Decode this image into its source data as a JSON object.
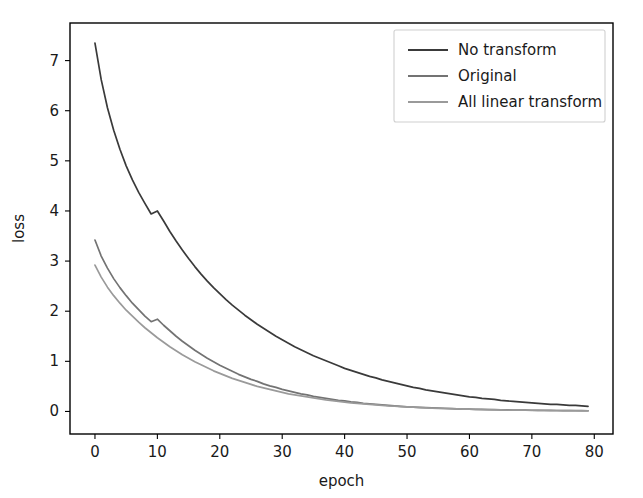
{
  "chart_data": {
    "type": "line",
    "title": "",
    "xlabel": "epoch",
    "ylabel": "loss",
    "xlim": [
      -4,
      83
    ],
    "ylim": [
      -0.45,
      7.75
    ],
    "xticks": [
      0,
      10,
      20,
      30,
      40,
      50,
      60,
      70,
      80
    ],
    "xticklabels": [
      "0",
      "10",
      "20",
      "30",
      "40",
      "50",
      "60",
      "70",
      "80"
    ],
    "yticks": [
      0,
      1,
      2,
      3,
      4,
      5,
      6,
      7
    ],
    "yticklabels": [
      "0",
      "1",
      "2",
      "3",
      "4",
      "5",
      "6",
      "7"
    ],
    "grid": false,
    "legend_position": "upper right",
    "x": [
      0,
      1,
      2,
      3,
      4,
      5,
      6,
      7,
      8,
      9,
      10,
      11,
      12,
      13,
      14,
      15,
      16,
      17,
      18,
      19,
      20,
      21,
      22,
      23,
      24,
      25,
      26,
      27,
      28,
      29,
      30,
      31,
      32,
      33,
      34,
      35,
      36,
      37,
      38,
      39,
      40,
      41,
      42,
      43,
      44,
      45,
      46,
      47,
      48,
      49,
      50,
      51,
      52,
      53,
      54,
      55,
      56,
      57,
      58,
      59,
      60,
      61,
      62,
      63,
      64,
      65,
      66,
      67,
      68,
      69,
      70,
      71,
      72,
      73,
      74,
      75,
      76,
      77,
      78,
      79
    ],
    "series": [
      {
        "name": "No transform",
        "color": "#3a3a3a",
        "values": [
          7.35,
          6.62,
          6.06,
          5.61,
          5.23,
          4.9,
          4.62,
          4.37,
          4.15,
          3.94,
          4.0,
          3.8,
          3.59,
          3.4,
          3.22,
          3.05,
          2.89,
          2.74,
          2.6,
          2.47,
          2.35,
          2.23,
          2.12,
          2.02,
          1.92,
          1.83,
          1.74,
          1.66,
          1.58,
          1.5,
          1.43,
          1.36,
          1.29,
          1.23,
          1.17,
          1.11,
          1.06,
          1.01,
          0.96,
          0.91,
          0.86,
          0.82,
          0.78,
          0.74,
          0.7,
          0.67,
          0.63,
          0.6,
          0.57,
          0.54,
          0.51,
          0.48,
          0.46,
          0.43,
          0.41,
          0.39,
          0.37,
          0.35,
          0.33,
          0.31,
          0.29,
          0.28,
          0.26,
          0.25,
          0.24,
          0.22,
          0.21,
          0.2,
          0.19,
          0.18,
          0.17,
          0.16,
          0.15,
          0.14,
          0.14,
          0.13,
          0.12,
          0.12,
          0.11,
          0.1
        ]
      },
      {
        "name": "Original",
        "color": "#737373",
        "values": [
          3.42,
          3.1,
          2.86,
          2.65,
          2.47,
          2.31,
          2.16,
          2.03,
          1.9,
          1.79,
          1.84,
          1.72,
          1.61,
          1.5,
          1.4,
          1.31,
          1.22,
          1.14,
          1.06,
          0.99,
          0.92,
          0.86,
          0.8,
          0.74,
          0.69,
          0.64,
          0.6,
          0.55,
          0.51,
          0.48,
          0.44,
          0.41,
          0.38,
          0.35,
          0.33,
          0.3,
          0.28,
          0.26,
          0.24,
          0.22,
          0.21,
          0.19,
          0.18,
          0.16,
          0.15,
          0.14,
          0.13,
          0.12,
          0.11,
          0.1,
          0.09,
          0.085,
          0.08,
          0.075,
          0.07,
          0.065,
          0.06,
          0.055,
          0.05,
          0.048,
          0.045,
          0.042,
          0.04,
          0.038,
          0.035,
          0.033,
          0.031,
          0.029,
          0.027,
          0.026,
          0.024,
          0.023,
          0.022,
          0.02,
          0.019,
          0.018,
          0.017,
          0.016,
          0.015,
          0.014
        ]
      },
      {
        "name": "All linear transform",
        "color": "#9a9a9a",
        "values": [
          2.92,
          2.68,
          2.48,
          2.31,
          2.16,
          2.02,
          1.9,
          1.78,
          1.67,
          1.57,
          1.47,
          1.38,
          1.29,
          1.21,
          1.13,
          1.06,
          0.99,
          0.93,
          0.87,
          0.81,
          0.76,
          0.71,
          0.66,
          0.62,
          0.58,
          0.54,
          0.5,
          0.47,
          0.44,
          0.41,
          0.38,
          0.35,
          0.33,
          0.31,
          0.29,
          0.27,
          0.25,
          0.23,
          0.215,
          0.2,
          0.185,
          0.17,
          0.16,
          0.15,
          0.14,
          0.13,
          0.12,
          0.11,
          0.105,
          0.098,
          0.09,
          0.084,
          0.078,
          0.073,
          0.068,
          0.063,
          0.059,
          0.055,
          0.051,
          0.047,
          0.044,
          0.041,
          0.038,
          0.036,
          0.033,
          0.031,
          0.029,
          0.027,
          0.025,
          0.024,
          0.022,
          0.021,
          0.019,
          0.018,
          0.017,
          0.016,
          0.015,
          0.014,
          0.013,
          0.012
        ]
      }
    ]
  },
  "legend": {
    "entries": [
      {
        "label": "No transform"
      },
      {
        "label": "Original"
      },
      {
        "label": "All linear transform"
      }
    ]
  }
}
